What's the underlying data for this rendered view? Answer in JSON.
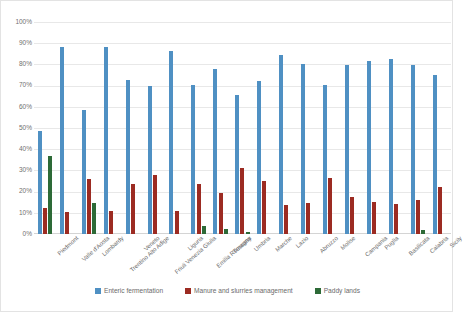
{
  "chart_data": {
    "type": "bar",
    "title": "",
    "xlabel": "",
    "ylabel": "",
    "ylim": [
      0,
      100
    ],
    "ytick_labels": [
      "100%",
      "90%",
      "80%",
      "70%",
      "60%",
      "50%",
      "40%",
      "30%",
      "20%",
      "10%",
      "0%"
    ],
    "ytick_values": [
      100,
      90,
      80,
      70,
      60,
      50,
      40,
      30,
      20,
      10,
      0
    ],
    "grid": true,
    "legend_position": "bottom",
    "categories": [
      "Piedmont",
      "Valle d'Aosta",
      "Lombardy",
      "Trentino Alto Adige",
      "Veneto",
      "Friuli Venezia Giulia",
      "Liguria",
      "Emilia Romagna",
      "Tuscany",
      "Umbria",
      "Marche",
      "Lazio",
      "Abruzzo",
      "Molise",
      "Campania",
      "Puglia",
      "Basilicata",
      "Calabria",
      "Sicily"
    ],
    "series": [
      {
        "name": "Enteric fermentation",
        "color": "#4f90c3",
        "values": [
          48.5,
          88.0,
          58.5,
          88.0,
          72.5,
          70.0,
          86.5,
          70.5,
          78.0,
          65.5,
          72.0,
          84.5,
          80.0,
          70.5,
          79.5,
          81.5,
          82.5,
          79.5,
          75.0
        ]
      },
      {
        "name": "Manure and slurries management",
        "color": "#9c2b22",
        "values": [
          12.5,
          10.5,
          26.0,
          10.8,
          23.5,
          28.0,
          11.0,
          23.5,
          19.5,
          31.0,
          25.0,
          13.5,
          14.5,
          26.5,
          17.5,
          15.0,
          14.0,
          16.0,
          22.0
        ]
      },
      {
        "name": "Paddy lands",
        "color": "#2d6a37",
        "values": [
          37.0,
          0.0,
          14.5,
          0.0,
          0.0,
          0.0,
          0.0,
          4.0,
          2.5,
          1.0,
          0.0,
          0.0,
          0.0,
          0.0,
          0.0,
          0.0,
          0.0,
          2.0,
          0.0
        ]
      }
    ]
  },
  "legend": {
    "items": [
      {
        "label": "Enteric fermentation",
        "color": "#4f90c3"
      },
      {
        "label": "Manure and slurries management",
        "color": "#9c2b22"
      },
      {
        "label": "Paddy lands",
        "color": "#2d6a37"
      }
    ]
  }
}
